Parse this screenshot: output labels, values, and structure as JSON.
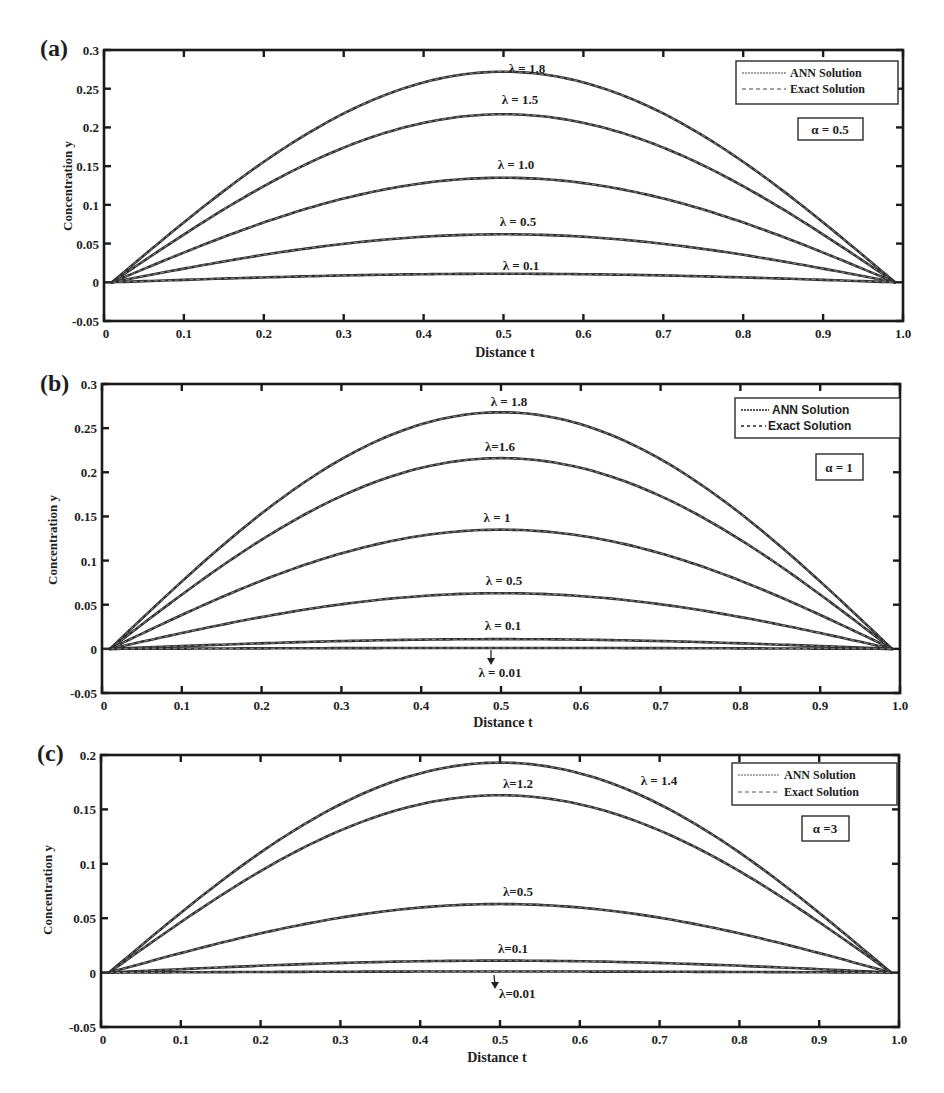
{
  "chart_data": [
    {
      "panel": "(a)",
      "type": "line",
      "title": "",
      "xlabel": "Distance t",
      "ylabel": "Concentration y",
      "xlim": [
        0,
        1.0
      ],
      "ylim": [
        -0.05,
        0.3
      ],
      "xticks": [
        "0",
        "0.1",
        "0.2",
        "0.3",
        "0.4",
        "0.5",
        "0.6",
        "0.7",
        "0.8",
        "0.9",
        "1.0"
      ],
      "yticks": [
        "-0.05",
        "0",
        "0.05",
        "0.1",
        "0.15",
        "0.2",
        "0.25",
        "0.3"
      ],
      "grid": false,
      "legend": {
        "position": "upper right",
        "entries": [
          "ANN Solution",
          "Exact Solution"
        ]
      },
      "annotation": "α = 0.5",
      "x": [
        0,
        0.1,
        0.2,
        0.3,
        0.4,
        0.5,
        0.6,
        0.7,
        0.8,
        0.9,
        1.0
      ],
      "series": [
        {
          "name": "λ = 1.8",
          "label": "λ = 1.8",
          "peak": 0.272,
          "values": [
            0,
            0.09,
            0.165,
            0.225,
            0.262,
            0.272,
            0.262,
            0.225,
            0.165,
            0.09,
            0
          ]
        },
        {
          "name": "λ = 1.5",
          "label": "λ = 1.5",
          "peak": 0.217,
          "values": [
            0,
            0.073,
            0.133,
            0.18,
            0.209,
            0.217,
            0.209,
            0.18,
            0.133,
            0.073,
            0
          ]
        },
        {
          "name": "λ = 1.0",
          "label": "λ = 1.0",
          "peak": 0.135,
          "values": [
            0,
            0.046,
            0.084,
            0.113,
            0.13,
            0.135,
            0.13,
            0.113,
            0.084,
            0.046,
            0
          ]
        },
        {
          "name": "λ = 0.5",
          "label": "λ = 0.5",
          "peak": 0.062,
          "values": [
            0,
            0.022,
            0.039,
            0.052,
            0.06,
            0.062,
            0.06,
            0.052,
            0.039,
            0.022,
            0
          ]
        },
        {
          "name": "λ = 0.1",
          "label": "λ = 0.1",
          "peak": 0.011,
          "values": [
            0,
            0.004,
            0.007,
            0.009,
            0.011,
            0.011,
            0.011,
            0.009,
            0.007,
            0.004,
            0
          ]
        }
      ]
    },
    {
      "panel": "(b)",
      "type": "line",
      "title": "",
      "xlabel": "Distance t",
      "ylabel": "Concentration y",
      "xlim": [
        0,
        1.0
      ],
      "ylim": [
        -0.05,
        0.3
      ],
      "xticks": [
        "0",
        "0.1",
        "0.2",
        "0.3",
        "0.4",
        "0.5",
        "0.6",
        "0.7",
        "0.8",
        "0.9",
        "1.0"
      ],
      "yticks": [
        "-0.05",
        "0",
        "0.05",
        "0.1",
        "0.15",
        "0.2",
        "0.25",
        "0.3"
      ],
      "grid": false,
      "legend": {
        "position": "upper right",
        "entries": [
          "ANN Solution",
          "Exact Solution"
        ]
      },
      "annotation": "α = 1",
      "x": [
        0,
        0.1,
        0.2,
        0.3,
        0.4,
        0.5,
        0.6,
        0.7,
        0.8,
        0.9,
        1.0
      ],
      "series": [
        {
          "name": "λ = 1.8",
          "label": "λ = 1.8",
          "peak": 0.268,
          "values": [
            0,
            0.089,
            0.163,
            0.222,
            0.258,
            0.268,
            0.258,
            0.222,
            0.163,
            0.089,
            0
          ]
        },
        {
          "name": "λ=1.6",
          "label": "λ=1.6",
          "peak": 0.216,
          "values": [
            0,
            0.072,
            0.132,
            0.179,
            0.208,
            0.216,
            0.208,
            0.179,
            0.132,
            0.072,
            0
          ]
        },
        {
          "name": "λ = 1",
          "label": "λ = 1",
          "peak": 0.135,
          "values": [
            0,
            0.046,
            0.084,
            0.113,
            0.13,
            0.135,
            0.13,
            0.113,
            0.084,
            0.046,
            0
          ]
        },
        {
          "name": "λ = 0.5",
          "label": "λ = 0.5",
          "peak": 0.063,
          "values": [
            0,
            0.022,
            0.04,
            0.053,
            0.061,
            0.063,
            0.061,
            0.053,
            0.04,
            0.022,
            0
          ]
        },
        {
          "name": "λ = 0.1",
          "label": "λ = 0.1",
          "peak": 0.011,
          "values": [
            0,
            0.004,
            0.007,
            0.009,
            0.011,
            0.011,
            0.011,
            0.009,
            0.007,
            0.004,
            0
          ]
        },
        {
          "name": "λ = 0.01",
          "label": "λ = 0.01",
          "peak": 0.001,
          "values": [
            0,
            0.0004,
            0.0007,
            0.0009,
            0.001,
            0.001,
            0.001,
            0.0009,
            0.0007,
            0.0004,
            0
          ]
        }
      ]
    },
    {
      "panel": "(c)",
      "type": "line",
      "title": "",
      "xlabel": "Distance t",
      "ylabel": "Concentration y",
      "xlim": [
        0,
        1.0
      ],
      "ylim": [
        -0.05,
        0.2
      ],
      "xticks": [
        "0",
        "0.1",
        "0.2",
        "0.3",
        "0.4",
        "0.5",
        "0.6",
        "0.7",
        "0.8",
        "0.9",
        "1.0"
      ],
      "yticks": [
        "-0.05",
        "0",
        "0.05",
        "0.1",
        "0.15",
        "0.2"
      ],
      "grid": false,
      "legend": {
        "position": "upper right",
        "entries": [
          "ANN Solution",
          "Exact Solution"
        ]
      },
      "annotation": "α =3",
      "x": [
        0,
        0.1,
        0.2,
        0.3,
        0.4,
        0.5,
        0.6,
        0.7,
        0.8,
        0.9,
        1.0
      ],
      "series": [
        {
          "name": "λ = 1.4",
          "label": "λ = 1.4",
          "peak": 0.193,
          "values": [
            0,
            0.064,
            0.117,
            0.159,
            0.185,
            0.193,
            0.185,
            0.159,
            0.117,
            0.064,
            0
          ]
        },
        {
          "name": "λ=1.2",
          "label": "λ=1.2",
          "peak": 0.163,
          "values": [
            0,
            0.054,
            0.099,
            0.134,
            0.156,
            0.163,
            0.156,
            0.134,
            0.099,
            0.054,
            0
          ]
        },
        {
          "name": "λ=0.5",
          "label": "λ=0.5",
          "peak": 0.063,
          "values": [
            0,
            0.022,
            0.04,
            0.053,
            0.061,
            0.063,
            0.061,
            0.053,
            0.04,
            0.022,
            0
          ]
        },
        {
          "name": "λ=0.1",
          "label": "λ=0.1",
          "peak": 0.011,
          "values": [
            0,
            0.004,
            0.007,
            0.009,
            0.011,
            0.011,
            0.011,
            0.009,
            0.007,
            0.004,
            0
          ]
        },
        {
          "name": "λ=0.01",
          "label": "λ=0.01",
          "peak": 0.001,
          "values": [
            0,
            0.0004,
            0.0007,
            0.0009,
            0.001,
            0.001,
            0.001,
            0.0009,
            0.0007,
            0.0004,
            0
          ]
        }
      ]
    }
  ],
  "figure": {
    "panels": [
      {
        "tag": "(a)",
        "xlabel": "Distance t",
        "ylabel": "Concentration y",
        "legend_ann": "ANN Solution",
        "legend_exact": "Exact Solution",
        "alpha": "α = 0.5",
        "labels": [
          "λ = 1.8",
          "λ = 1.5",
          "λ = 1.0",
          "λ = 0.5",
          "λ = 0.1"
        ]
      },
      {
        "tag": "(b)",
        "xlabel": "Distance t",
        "ylabel": "Concentration y",
        "legend_ann": "ANN Solution",
        "legend_exact": "Exact Solution",
        "alpha": "α = 1",
        "labels": [
          "λ = 1.8",
          "λ=1.6",
          "λ = 1",
          "λ = 0.5",
          "λ = 0.1",
          "λ = 0.01"
        ]
      },
      {
        "tag": "(c)",
        "xlabel": "Distance t",
        "ylabel": "Concentration y",
        "legend_ann": "ANN Solution",
        "legend_exact": "Exact Solution",
        "alpha": "α =3",
        "labels": [
          "λ = 1.4",
          "λ=1.2",
          "λ=0.5",
          "λ=0.1",
          "λ=0.01"
        ]
      }
    ],
    "line_color": "#2f2f2f",
    "axis_color": "#1a1a1a"
  }
}
